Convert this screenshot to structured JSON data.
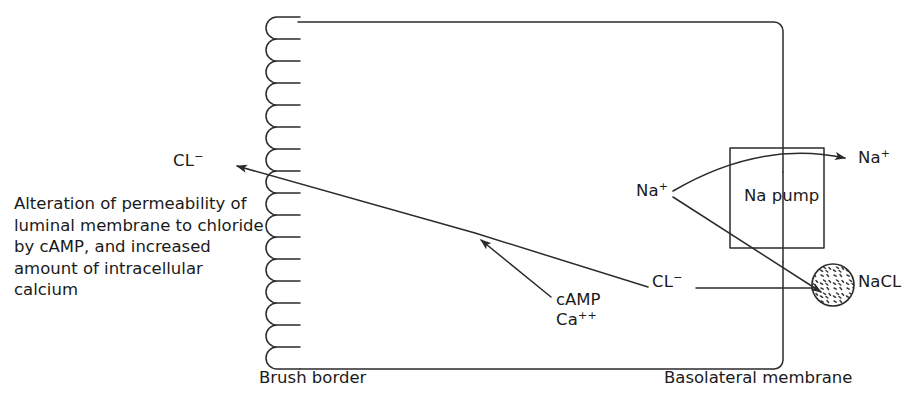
{
  "diagram": {
    "type": "biological-schematic",
    "canvas": {
      "width": 920,
      "height": 410
    },
    "colors": {
      "background": "#ffffff",
      "stroke": "#2b2b2b",
      "text": "#1a1a1a",
      "stipple": "#3a3a3a"
    },
    "labels": {
      "description": "Alteration of permeability of luminal membrane to chloride by cAMP, and increased amount of intracellular calcium",
      "chloride_left": "CL",
      "chloride_left_charge": "−",
      "chloride_right": "CL",
      "chloride_right_charge": "−",
      "sodium_in": "Na",
      "sodium_in_charge": "+",
      "sodium_out": "Na",
      "sodium_out_charge": "+",
      "na_pump": "Na pump",
      "nacl": "NaCL",
      "camp": "cAMP",
      "calcium": "Ca",
      "calcium_charge": "++",
      "brush_border": "Brush border",
      "basolateral_membrane": "Basolateral membrane"
    },
    "structures": [
      {
        "name": "brush-border-microvilli",
        "shape": "serpentine",
        "loops": 16,
        "x": 263,
        "y_start": 17,
        "y_end": 377
      },
      {
        "name": "cell-outline",
        "shape": "path",
        "top_y": 22,
        "bottom_y": 370,
        "right_x": 782
      },
      {
        "name": "na-pump-box",
        "shape": "rect",
        "x": 730,
        "y": 148,
        "width": 94,
        "height": 100
      },
      {
        "name": "nacl-vesicle",
        "shape": "circle-stippled",
        "cx": 833,
        "cy": 285,
        "r": 21
      }
    ],
    "arrows": [
      {
        "name": "chloride-efflux-arrow",
        "from": [
          648,
          286
        ],
        "to": [
          224,
          163
        ],
        "head": "end"
      },
      {
        "name": "camp-calcium-arrow",
        "from": [
          551,
          297
        ],
        "to": [
          473,
          234
        ],
        "head": "end"
      },
      {
        "name": "sodium-pump-arrow",
        "from": [
          672,
          192
        ],
        "to": [
          852,
          158
        ],
        "head": "end",
        "curved": true
      },
      {
        "name": "sodium-to-nacl-arrow",
        "from": [
          672,
          196
        ],
        "to": [
          828,
          292
        ],
        "head": "end"
      },
      {
        "name": "chloride-to-nacl-line",
        "from": [
          694,
          288
        ],
        "to": [
          812,
          288
        ],
        "head": "none"
      }
    ]
  }
}
